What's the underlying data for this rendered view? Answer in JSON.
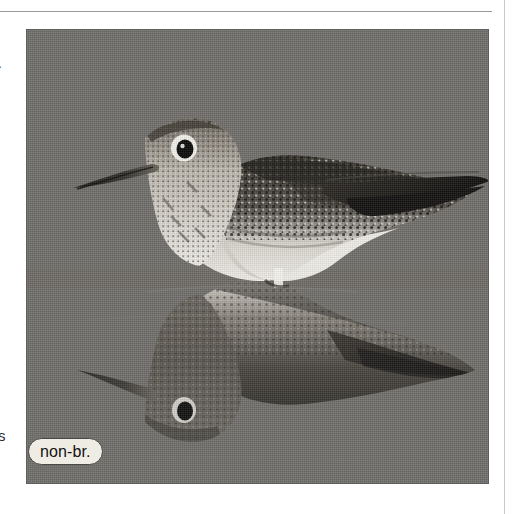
{
  "page": {
    "background_color": "#ffffff",
    "rule_color": "#9a9a9a",
    "margin_fragments": {
      "top_dash": "-",
      "bottom_letter": "s"
    }
  },
  "photo_plate": {
    "background_color": "#6e6e6e",
    "subject": "shorebird-with-water-reflection",
    "description": "Greater Yellowlegs type shorebird standing in shallow water with mirrored reflection below",
    "plumage_badge": {
      "label": "non-br.",
      "text_color": "#121212",
      "fill_color": "#efece4",
      "border_color": "#4a4a4a"
    },
    "tones": {
      "water": "#6e6e6e",
      "plumage_dark": "#1e1e1e",
      "plumage_light": "#e8e6e0",
      "bill": "#2a2a2a",
      "eye": "#0d0d0d",
      "reflection_shade": "#4a4a4a"
    }
  }
}
